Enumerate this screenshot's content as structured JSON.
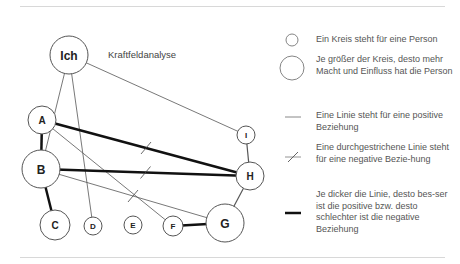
{
  "diagram": {
    "title": "Kraftfeldanalyse",
    "nodes": [
      {
        "id": "Ich",
        "label": "Ich",
        "x": 69,
        "y": 55,
        "r": 19,
        "fs": 12
      },
      {
        "id": "A",
        "label": "A",
        "x": 42,
        "y": 120,
        "r": 14,
        "fs": 10
      },
      {
        "id": "B",
        "label": "B",
        "x": 41,
        "y": 169,
        "r": 19,
        "fs": 12
      },
      {
        "id": "C",
        "label": "C",
        "x": 55,
        "y": 225,
        "r": 15,
        "fs": 10
      },
      {
        "id": "D",
        "label": "D",
        "x": 93,
        "y": 226,
        "r": 9,
        "fs": 8
      },
      {
        "id": "E",
        "label": "E",
        "x": 133,
        "y": 225,
        "r": 9,
        "fs": 8
      },
      {
        "id": "F",
        "label": "F",
        "x": 173,
        "y": 226,
        "r": 10,
        "fs": 8
      },
      {
        "id": "G",
        "label": "G",
        "x": 225,
        "y": 223,
        "r": 19,
        "fs": 12
      },
      {
        "id": "H",
        "label": "H",
        "x": 250,
        "y": 176,
        "r": 14,
        "fs": 10
      },
      {
        "id": "I",
        "label": "I",
        "x": 246,
        "y": 135,
        "r": 9,
        "fs": 8
      }
    ],
    "edges": [
      {
        "from": "Ich",
        "to": "B",
        "width": 0.8,
        "negative": false
      },
      {
        "from": "Ich",
        "to": "D",
        "width": 0.8,
        "negative": false
      },
      {
        "from": "Ich",
        "to": "I",
        "width": 0.8,
        "negative": false
      },
      {
        "from": "A",
        "to": "B",
        "width": 2.5,
        "negative": false
      },
      {
        "from": "A",
        "to": "H",
        "width": 2.5,
        "negative": true
      },
      {
        "from": "A",
        "to": "F",
        "width": 0.8,
        "negative": false
      },
      {
        "from": "B",
        "to": "H",
        "width": 2.5,
        "negative": true
      },
      {
        "from": "B",
        "to": "G",
        "width": 0.8,
        "negative": true
      },
      {
        "from": "B",
        "to": "C",
        "width": 2.5,
        "negative": false
      },
      {
        "from": "F",
        "to": "G",
        "width": 2.5,
        "negative": false
      },
      {
        "from": "G",
        "to": "H",
        "width": 1.2,
        "negative": false
      },
      {
        "from": "H",
        "to": "I",
        "width": 1.2,
        "negative": false
      }
    ]
  },
  "legend": {
    "items": [
      {
        "symbol": "small-circle",
        "text": "Ein Kreis steht für eine Person"
      },
      {
        "symbol": "large-circle",
        "text": "Je größer der Kreis, desto mehr Macht und Einfluss hat die Person"
      },
      {
        "symbol": "thin-line",
        "text": "Eine Linie steht für eine positive Beziehung"
      },
      {
        "symbol": "crossed-line",
        "text": "Eine durchgestrichene Linie steht für eine negative Bezie-hung"
      },
      {
        "symbol": "thick-line",
        "text": "Je dicker die Linie, desto bes-ser ist die positive bzw. desto schlechter ist die negative Beziehung"
      }
    ]
  },
  "colors": {
    "line": "#111111",
    "thin_line": "#555555",
    "circle_stroke": "#555555",
    "text": "#555555"
  }
}
